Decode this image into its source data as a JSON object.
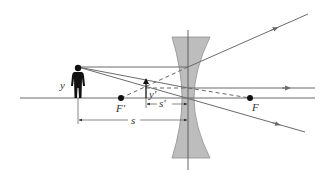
{
  "diagram": {
    "labels": {
      "object_height": "y",
      "image_height": "y'",
      "object_distance": "s",
      "image_distance": "s'",
      "front_focal_point": "F'",
      "back_focal_point": "F"
    },
    "elements": {
      "object": "standing person (object)",
      "image": "upright virtual image arrow",
      "lens": "concave (diverging) lens",
      "optical_axis": "horizontal optical axis"
    },
    "colors": {
      "ray": "#6b6b6b",
      "lens_fill": "#b8b8b8",
      "lens_stroke": "#8a8a8a",
      "axis": "#6b6b6b",
      "object": "#111111",
      "text": "#333333"
    }
  }
}
